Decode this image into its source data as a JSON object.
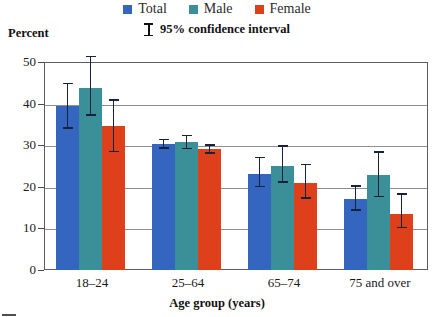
{
  "chart_data": {
    "type": "bar",
    "title": "",
    "subtitle": "",
    "xlabel": "Age group (years)",
    "ylabel": "Percent",
    "ylim": [
      0,
      50
    ],
    "yticks": [
      0,
      10,
      20,
      30,
      40,
      50
    ],
    "grid": true,
    "legend_position": "top-center",
    "annotation": "95% confidence interval",
    "categories": [
      "18–24",
      "25–64",
      "65–74",
      "75 and over"
    ],
    "series": [
      {
        "name": "Total",
        "color": "#3566bf",
        "values": [
          39.5,
          30.3,
          23.0,
          17.0
        ],
        "ci_low": [
          34.0,
          29.2,
          19.9,
          14.2
        ],
        "ci_high": [
          45.0,
          31.6,
          27.2,
          20.4
        ]
      },
      {
        "name": "Male",
        "color": "#3a8f98",
        "values": [
          43.8,
          30.7,
          25.0,
          22.8
        ],
        "ci_low": [
          37.0,
          29.0,
          21.0,
          17.5
        ],
        "ci_high": [
          51.5,
          32.5,
          30.0,
          28.5
        ]
      },
      {
        "name": "Female",
        "color": "#de401c",
        "values": [
          34.5,
          29.0,
          21.0,
          13.5
        ],
        "ci_low": [
          28.3,
          27.9,
          17.1,
          10.0
        ],
        "ci_high": [
          41.0,
          30.2,
          25.6,
          18.5
        ]
      }
    ]
  },
  "legend": {
    "items": [
      {
        "label": "Total",
        "color": "#3566bf"
      },
      {
        "label": "Male",
        "color": "#3a8f98"
      },
      {
        "label": "Female",
        "color": "#de401c"
      }
    ]
  },
  "ci_note": {
    "text": "95% confidence interval",
    "icon": "error-bar-icon"
  },
  "axes": {
    "y_title": "Percent",
    "x_title": "Age group (years)",
    "y_tick_labels": [
      "50",
      "40",
      "30",
      "20",
      "10",
      "0"
    ],
    "x_tick_labels": [
      "18–24",
      "25–64",
      "65–74",
      "75 and over"
    ]
  }
}
